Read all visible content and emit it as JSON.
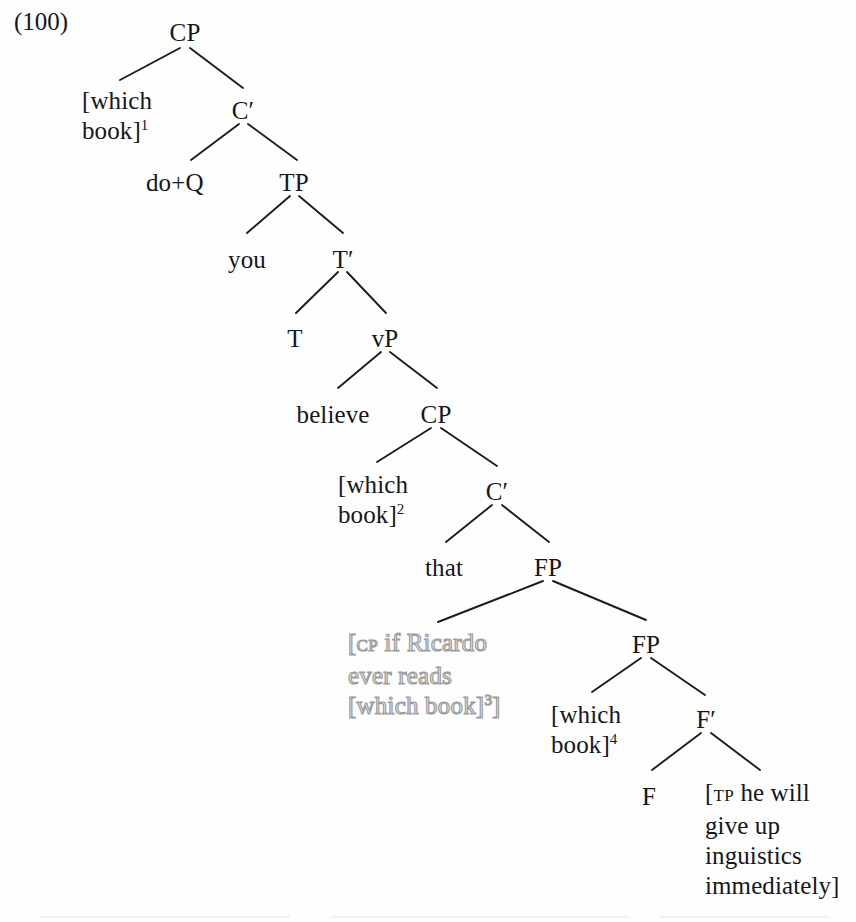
{
  "example": {
    "number": "(100)"
  },
  "tree": {
    "type": "x-bar-syntax-tree",
    "nodes": [
      {
        "id": "cp1",
        "label": "CP",
        "x": 185,
        "y": 18,
        "align": "center",
        "style": "normal"
      },
      {
        "id": "whichbook1",
        "label": "[which\nbook]",
        "sup": "1",
        "x": 82,
        "y": 86,
        "align": "left",
        "style": "normal"
      },
      {
        "id": "cbar1",
        "label": "C′",
        "x": 243,
        "y": 96,
        "align": "center",
        "style": "normal"
      },
      {
        "id": "doq",
        "label": "do+Q",
        "x": 146,
        "y": 168,
        "align": "left",
        "style": "normal"
      },
      {
        "id": "tp",
        "label": "TP",
        "x": 294,
        "y": 168,
        "align": "center",
        "style": "normal"
      },
      {
        "id": "you",
        "label": "you",
        "x": 247,
        "y": 245,
        "align": "center",
        "style": "normal"
      },
      {
        "id": "tbar",
        "label": "T′",
        "x": 343,
        "y": 245,
        "align": "center",
        "style": "normal"
      },
      {
        "id": "t",
        "label": "T",
        "x": 295,
        "y": 324,
        "align": "center",
        "style": "normal"
      },
      {
        "id": "vp",
        "label": "vP",
        "x": 385,
        "y": 324,
        "align": "center",
        "style": "normal"
      },
      {
        "id": "believe",
        "label": "believe",
        "x": 333,
        "y": 400,
        "align": "center",
        "style": "normal"
      },
      {
        "id": "cp2",
        "label": "CP",
        "x": 436,
        "y": 400,
        "align": "center",
        "style": "normal"
      },
      {
        "id": "whichbook2",
        "label": "[which\nbook]",
        "sup": "2",
        "x": 338,
        "y": 470,
        "align": "left",
        "style": "normal"
      },
      {
        "id": "cbar2",
        "label": "C′",
        "x": 497,
        "y": 477,
        "align": "center",
        "style": "normal"
      },
      {
        "id": "that",
        "label": "that",
        "x": 444,
        "y": 553,
        "align": "center",
        "style": "normal"
      },
      {
        "id": "fp1",
        "label": "FP",
        "x": 548,
        "y": 553,
        "align": "center",
        "style": "normal"
      },
      {
        "id": "ghostcp",
        "label": "[CP if Ricardo\never reads\n[which book]3]",
        "x": 348,
        "y": 628,
        "align": "left",
        "style": "ghost"
      },
      {
        "id": "fp2",
        "label": "FP",
        "x": 646,
        "y": 630,
        "align": "center",
        "style": "normal"
      },
      {
        "id": "whichbook4",
        "label": "[which\nbook]",
        "sup": "4",
        "x": 551,
        "y": 700,
        "align": "left",
        "style": "normal"
      },
      {
        "id": "fbar",
        "label": "F′",
        "x": 706,
        "y": 705,
        "align": "center",
        "style": "normal"
      },
      {
        "id": "f",
        "label": "F",
        "x": 649,
        "y": 782,
        "align": "center",
        "style": "normal"
      },
      {
        "id": "tpblock",
        "label": "[TP he will\ngive up\ninguistics\nimmediately]",
        "x": 705,
        "y": 778,
        "align": "left",
        "style": "normal"
      }
    ],
    "ghost_text": {
      "line1_bracket": "[",
      "line1_subscript": "CP",
      "line1_rest": " if Ricardo",
      "line2": "ever reads",
      "line3_pre": "[which book]",
      "line3_sup": "3",
      "line3_post": "]"
    },
    "tp_block_text": {
      "bracket": "[",
      "subscript": "TP",
      "line1": " he will",
      "line2": "give up",
      "line3": "inguistics",
      "line4": "immediately]"
    },
    "branches": [
      {
        "from": "cp1",
        "to": "whichbook1",
        "x1": 180,
        "y1": 48,
        "x2": 120,
        "y2": 80
      },
      {
        "from": "cp1",
        "to": "cbar1",
        "x1": 190,
        "y1": 48,
        "x2": 243,
        "y2": 88
      },
      {
        "from": "cbar1",
        "to": "doq",
        "x1": 239,
        "y1": 124,
        "x2": 191,
        "y2": 160
      },
      {
        "from": "cbar1",
        "to": "tp",
        "x1": 248,
        "y1": 124,
        "x2": 297,
        "y2": 160
      },
      {
        "from": "tp",
        "to": "you",
        "x1": 290,
        "y1": 196,
        "x2": 247,
        "y2": 233
      },
      {
        "from": "tp",
        "to": "tbar",
        "x1": 299,
        "y1": 196,
        "x2": 343,
        "y2": 233
      },
      {
        "from": "tbar",
        "to": "t",
        "x1": 338,
        "y1": 272,
        "x2": 296,
        "y2": 313
      },
      {
        "from": "tbar",
        "to": "vp",
        "x1": 347,
        "y1": 272,
        "x2": 386,
        "y2": 313
      },
      {
        "from": "vp",
        "to": "believe",
        "x1": 381,
        "y1": 352,
        "x2": 338,
        "y2": 388
      },
      {
        "from": "vp",
        "to": "cp2",
        "x1": 390,
        "y1": 352,
        "x2": 437,
        "y2": 388
      },
      {
        "from": "cp2",
        "to": "whichbook2",
        "x1": 431,
        "y1": 428,
        "x2": 377,
        "y2": 462
      },
      {
        "from": "cp2",
        "to": "cbar2",
        "x1": 441,
        "y1": 428,
        "x2": 497,
        "y2": 466
      },
      {
        "from": "cbar2",
        "to": "that",
        "x1": 492,
        "y1": 505,
        "x2": 446,
        "y2": 542
      },
      {
        "from": "cbar2",
        "to": "fp1",
        "x1": 502,
        "y1": 505,
        "x2": 549,
        "y2": 542
      },
      {
        "from": "fp1",
        "to": "ghostcp",
        "x1": 543,
        "y1": 581,
        "x2": 438,
        "y2": 622
      },
      {
        "from": "fp1",
        "to": "fp2",
        "x1": 553,
        "y1": 581,
        "x2": 646,
        "y2": 620
      },
      {
        "from": "fp2",
        "to": "whichbook4",
        "x1": 641,
        "y1": 658,
        "x2": 592,
        "y2": 692
      },
      {
        "from": "fp2",
        "to": "fbar",
        "x1": 651,
        "y1": 658,
        "x2": 705,
        "y2": 695
      },
      {
        "from": "fbar",
        "to": "f",
        "x1": 701,
        "y1": 733,
        "x2": 652,
        "y2": 770
      },
      {
        "from": "fbar",
        "to": "tpblock",
        "x1": 711,
        "y1": 733,
        "x2": 760,
        "y2": 770
      }
    ]
  }
}
